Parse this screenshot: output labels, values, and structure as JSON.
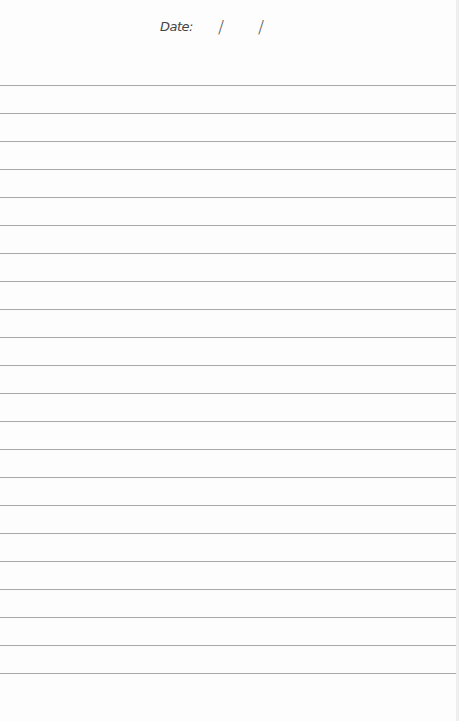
{
  "page": {
    "type": "lined-notepaper",
    "background": "#fdfdfd",
    "line_color": "#a9a9a9"
  },
  "header": {
    "date_label": "Date:",
    "date_separator_1": "/",
    "date_separator_2": "/"
  },
  "rules": {
    "first_y": 85,
    "spacing": 28,
    "count": 22
  }
}
